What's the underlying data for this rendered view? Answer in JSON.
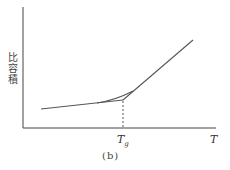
{
  "figure": {
    "y_axis_label": "比容積",
    "x_axis_label": "T",
    "tg_label": "T",
    "tg_subscript": "g",
    "caption": "(b)"
  },
  "colors": {
    "line": "#555555",
    "axis": "#444444",
    "background": "#ffffff"
  }
}
